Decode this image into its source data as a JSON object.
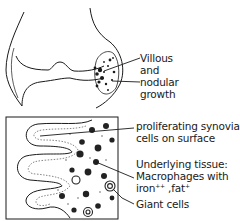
{
  "diagram": {
    "top_figure": {
      "subject": "joint-cross-section",
      "label_lines": [
        "Villous",
        "and",
        "nodular",
        "growth"
      ]
    },
    "bottom_figure": {
      "subject": "synovium-histology",
      "labels": {
        "synovial_line1": "proliferating synovial",
        "synovial_line2": "cells on surface",
        "tissue_line1": "Underlying tissue:",
        "tissue_line2": "Macrophages with",
        "tissue_iron": "iron",
        "tissue_iron_sup": "++",
        "tissue_sep": " ,fat",
        "tissue_fat_sup": "+",
        "giant": "Giant cells"
      }
    }
  }
}
